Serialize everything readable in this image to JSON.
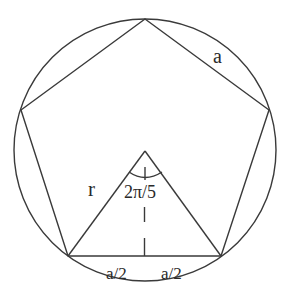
{
  "diagram": {
    "colors": {
      "stroke": "#3a3a3a",
      "text": "#2a2a2a",
      "background": "#ffffff"
    },
    "circle": {
      "cx": 145,
      "cy": 150,
      "r": 131
    },
    "pentagon": {
      "vertices": [
        {
          "name": "top",
          "x": 145,
          "y": 19
        },
        {
          "name": "right",
          "x": 269,
          "y": 110
        },
        {
          "name": "bottom-right",
          "x": 221,
          "y": 256
        },
        {
          "name": "bottom-left",
          "x": 68,
          "y": 256
        },
        {
          "name": "left",
          "x": 21,
          "y": 110
        }
      ]
    },
    "center": {
      "x": 145,
      "y": 151
    },
    "labels": {
      "side": "a",
      "radius": "r",
      "angle": "2π/5",
      "half_left": "a/2",
      "half_right": "a/2"
    }
  }
}
